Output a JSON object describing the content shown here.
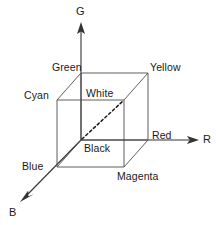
{
  "figure": {
    "type": "diagram",
    "stroke_color": "#4d4d4d",
    "axis_color": "#333333",
    "text_color": "#1a1a1a",
    "background": "#ffffff"
  },
  "axes": [
    {
      "id": "g",
      "label": "G",
      "direction": "up",
      "from": [
        81,
        140
      ],
      "to": [
        81,
        24
      ]
    },
    {
      "id": "r",
      "label": "R",
      "direction": "right",
      "from": [
        81,
        140
      ],
      "to": [
        198,
        140
      ]
    },
    {
      "id": "b",
      "label": "B",
      "direction": "down-left",
      "from": [
        81,
        140
      ],
      "to": [
        20,
        202
      ]
    }
  ],
  "vertices": [
    {
      "id": "black",
      "label": "Black",
      "at": [
        81,
        140
      ],
      "face": "back"
    },
    {
      "id": "red",
      "label": "Red",
      "at": [
        148,
        140
      ],
      "face": "back"
    },
    {
      "id": "green",
      "label": "Green",
      "at": [
        81,
        73
      ],
      "face": "back"
    },
    {
      "id": "yellow",
      "label": "Yellow",
      "at": [
        148,
        73
      ],
      "face": "back"
    },
    {
      "id": "blue",
      "label": "Blue",
      "at": [
        57,
        167
      ],
      "face": "front"
    },
    {
      "id": "magenta",
      "label": "Magenta",
      "at": [
        124,
        167
      ],
      "face": "front"
    },
    {
      "id": "cyan",
      "label": "Cyan",
      "at": [
        57,
        100
      ],
      "face": "front"
    },
    {
      "id": "white",
      "label": "White",
      "at": [
        124,
        100
      ],
      "face": "front"
    }
  ],
  "diagonal": {
    "id": "grayscale-axis",
    "from": "black",
    "to": "white",
    "style": "dashed"
  }
}
